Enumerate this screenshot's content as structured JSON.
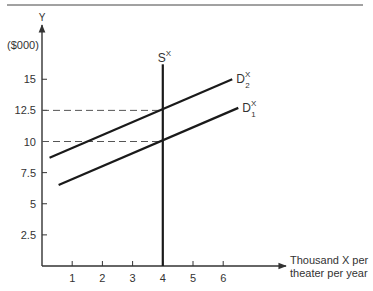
{
  "chart_data": {
    "type": "line",
    "title": "",
    "xlabel": "Thousand X per theater per year",
    "xlabel_lines": [
      "Thousand X per",
      "theater per year"
    ],
    "ylabel": "Y",
    "ylabel_unit": "($000)",
    "x_ticks": [
      1,
      2,
      3,
      4,
      5,
      6
    ],
    "y_ticks": [
      2.5,
      5,
      7.5,
      10,
      12.5,
      15
    ],
    "y_tick_labels": [
      "2.5",
      "5",
      "7.5",
      "10",
      "12.5",
      "15"
    ],
    "xlim": [
      0,
      8
    ],
    "ylim": [
      0,
      19
    ],
    "grid": false,
    "legend": "none (inline curve labels)",
    "series": [
      {
        "name": "S^X",
        "label_main": "S",
        "label_sup": "X",
        "label_sub": "",
        "style": "solid vertical",
        "x": [
          4,
          4
        ],
        "y": [
          0,
          16.2
        ]
      },
      {
        "name": "D_1^X",
        "label_main": "D",
        "label_sup": "X",
        "label_sub": "1",
        "style": "solid",
        "x": [
          0.55,
          6.5
        ],
        "y": [
          6.5,
          12.7
        ]
      },
      {
        "name": "D_2^X",
        "label_main": "D",
        "label_sup": "X",
        "label_sub": "2",
        "style": "solid",
        "x": [
          0.25,
          6.3
        ],
        "y": [
          8.7,
          15.0
        ]
      }
    ],
    "annotations": [
      {
        "type": "dashed_hline",
        "y": 12.5,
        "x_from": 0,
        "x_to": 4,
        "note": "equilibrium with D2 at x=4"
      },
      {
        "type": "dashed_hline",
        "y": 10,
        "x_from": 0,
        "x_to": 4,
        "note": "equilibrium with D1 at x=4"
      }
    ]
  }
}
